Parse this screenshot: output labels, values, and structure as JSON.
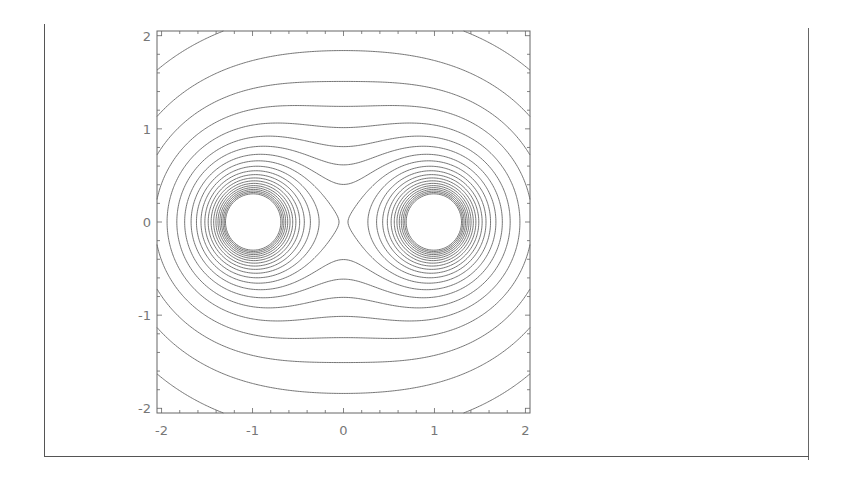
{
  "chart_data": {
    "type": "contour",
    "title": "",
    "xlabel": "",
    "ylabel": "",
    "xlim": [
      -2.05,
      2.05
    ],
    "ylim": [
      -2.05,
      2.05
    ],
    "grid": false,
    "legend": null,
    "function": "1/sqrt((x+1)^2+y^2) + 1/sqrt((x-1)^2+y^2)",
    "sources": [
      {
        "x": -1,
        "y": 0
      },
      {
        "x": 1,
        "y": 0
      }
    ],
    "contour_levels": [
      0.805,
      0.955,
      1.105,
      1.255,
      1.405,
      1.555,
      1.705,
      1.855,
      2.005,
      2.155,
      2.305,
      2.455,
      2.605,
      2.755,
      2.905,
      3.055,
      3.205,
      3.355,
      3.505,
      3.655,
      3.805
    ],
    "x_ticks": [
      {
        "value": -2,
        "label": "-2"
      },
      {
        "value": -1,
        "label": "-1"
      },
      {
        "value": 0,
        "label": "0"
      },
      {
        "value": 1,
        "label": "1"
      },
      {
        "value": 2,
        "label": "2"
      }
    ],
    "y_ticks": [
      {
        "value": 2,
        "label": "2"
      },
      {
        "value": 1,
        "label": "1"
      },
      {
        "value": 0,
        "label": "0"
      },
      {
        "value": -1,
        "label": "-1"
      },
      {
        "value": -2,
        "label": "-2"
      }
    ],
    "minor_tick_step": 0.2,
    "line_color": "#666666",
    "frame_color": "#666666"
  }
}
